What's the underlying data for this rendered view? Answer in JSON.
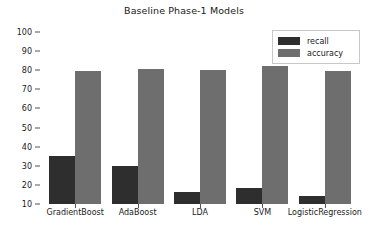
{
  "chart_data": {
    "type": "bar",
    "title": "Baseline Phase-1 Models",
    "xlabel": "",
    "ylabel": "",
    "categories": [
      "GradientBoost",
      "AdaBoost",
      "LDA",
      "SVM",
      "LogisticRegression"
    ],
    "series": [
      {
        "name": "recall",
        "color": "#2e2e2e",
        "values": [
          35,
          30,
          16.5,
          18.5,
          14
        ]
      },
      {
        "name": "accuracy",
        "color": "#6e6e6e",
        "values": [
          79.5,
          80.5,
          80,
          82,
          79.5
        ]
      }
    ],
    "ylim": [
      10,
      100
    ],
    "yticks": [
      10,
      20,
      30,
      40,
      50,
      60,
      70,
      80,
      90,
      100
    ],
    "ytick_labels": [
      "10",
      "20",
      "30",
      "40",
      "50",
      "60",
      "70",
      "80",
      "90",
      "100"
    ],
    "grid": false,
    "legend_position": "upper right",
    "legend_entries": [
      "recall",
      "accuracy"
    ],
    "background": "#ffffff"
  }
}
